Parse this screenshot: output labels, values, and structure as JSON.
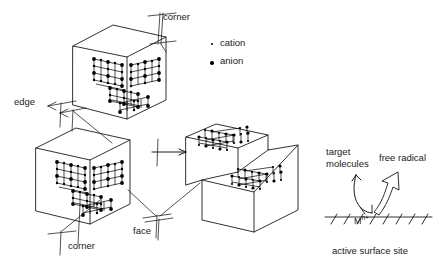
{
  "figure": {
    "line_color": "#1a1a1a",
    "marker_color": "#000000",
    "background": "#ffffff"
  },
  "legend": {
    "items": [
      {
        "symbol": "small-dot",
        "label": "cation",
        "size_px": 2.2
      },
      {
        "symbol": "large-dot",
        "label": "anion",
        "size_px": 3.4
      }
    ]
  },
  "callouts": [
    {
      "key": "corner_top",
      "label": "corner",
      "x": 163,
      "y": 16
    },
    {
      "key": "edge_left",
      "label": "edge",
      "x": 14,
      "y": 101
    },
    {
      "key": "corner_bottom",
      "label": "corner",
      "x": 64,
      "y": 245
    },
    {
      "key": "face_center",
      "label": "face",
      "x": 133,
      "y": 230
    }
  ],
  "mechanism": {
    "target_label_line1": "target",
    "target_label_line2": "molecules",
    "free_radical_label": "free radical",
    "site_label": "active surface site",
    "metal_ion": "M",
    "metal_ion_superscript": "n+"
  },
  "structures": [
    {
      "key": "cube-top",
      "description": "cube with corner lattice cluster"
    },
    {
      "key": "cube-bottom",
      "description": "cube with corner lattice cluster"
    },
    {
      "key": "step-block",
      "description": "stepped block with two terrace lattices"
    },
    {
      "key": "surface-site",
      "description": "hatched surface with metal ion and curved arrows"
    }
  ]
}
